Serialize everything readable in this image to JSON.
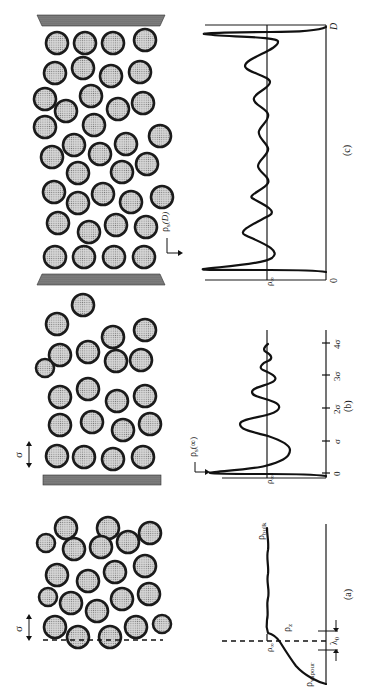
{
  "figure": {
    "orientation": "rotated 90 degrees counter-clockwise",
    "panels": [
      {
        "id": "a",
        "caption": "(a)",
        "description": "liquid-vapour interface",
        "labels": {
          "sigma": "σ",
          "rho_bulk": "ρbulk",
          "rho_bulk_main": "ρ",
          "rho_bulk_sub": "bulk",
          "rho_z": "ρz",
          "rho_z_main": "ρ",
          "rho_z_sub": "z",
          "rho_inf": "ρ∞",
          "rho_inf_main": "ρ",
          "rho_inf_sub": "∞",
          "rho_vapour": "ρvapour",
          "rho_vapour_main": "ρ",
          "rho_vapour_sub": "vapour",
          "lambda": "λ0",
          "lambda_main": "λ",
          "lambda_sub": "0"
        }
      },
      {
        "id": "b",
        "caption": "(b)",
        "description": "liquid near a single wall",
        "labels": {
          "sigma": "σ",
          "rho_s": "ρs(∞)",
          "rho_s_main": "ρ",
          "rho_s_sub": "s",
          "rho_s_arg": "(∞)",
          "rho_inf": "ρ∞",
          "rho_inf_main": "ρ",
          "rho_inf_sub": "∞"
        },
        "x_ticks": [
          "0",
          "σ",
          "2σ",
          "3σ",
          "4σ"
        ]
      },
      {
        "id": "c",
        "caption": "(c)",
        "description": "liquid confined between two walls",
        "labels": {
          "rho_s": "ρs(D)",
          "rho_s_main": "ρ",
          "rho_s_sub": "s",
          "rho_s_arg": "(D)",
          "rho_inf": "ρ∞",
          "rho_inf_main": "ρ",
          "rho_inf_sub": "∞",
          "x_start": "0",
          "x_end": "D"
        }
      }
    ]
  }
}
